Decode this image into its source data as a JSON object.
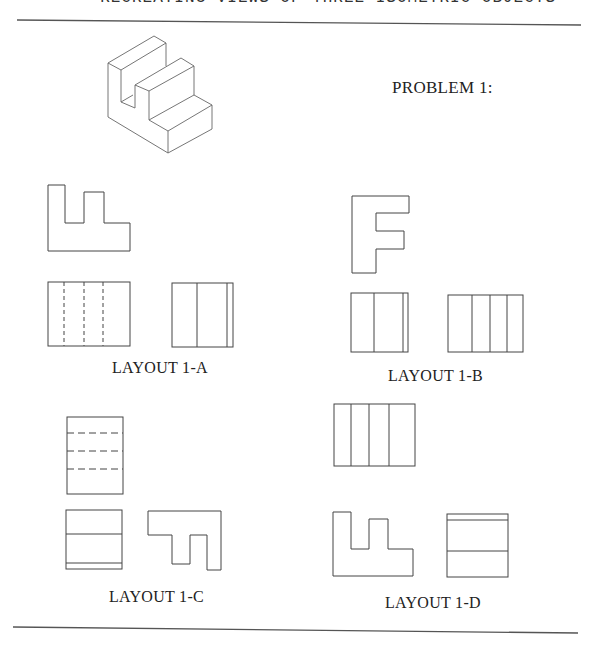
{
  "page": {
    "header_partial": "RECREATING VIEWS OF THREE ISOMETRIC OBJECTS",
    "problem_title": "PROBLEM 1:"
  },
  "isometric_object": {
    "description": "Isometric view of stepped block with vertical slot",
    "stroke_color": "#555555"
  },
  "layouts": [
    {
      "id": "1-A",
      "label": "LAYOUT 1-A",
      "views": [
        "top-profile",
        "front-with-hidden-lines",
        "side-view"
      ]
    },
    {
      "id": "1-B",
      "label": "LAYOUT 1-B",
      "views": [
        "F-profile",
        "side-view",
        "front-view"
      ]
    },
    {
      "id": "1-C",
      "label": "LAYOUT 1-C",
      "views": [
        "top-with-hidden-lines",
        "front-view",
        "inverted-profile"
      ]
    },
    {
      "id": "1-D",
      "label": "LAYOUT 1-D",
      "views": [
        "top-view",
        "front-profile",
        "side-view"
      ]
    }
  ],
  "colors": {
    "line": "#444444",
    "rule": "#555555",
    "background": "#ffffff"
  }
}
